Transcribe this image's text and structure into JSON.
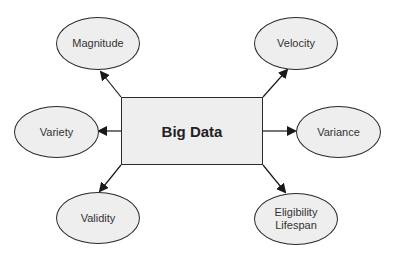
{
  "diagram": {
    "center": {
      "label": "Big Data"
    },
    "nodes": [
      {
        "id": "magnitude",
        "label": "Magnitude"
      },
      {
        "id": "velocity",
        "label": "Velocity"
      },
      {
        "id": "variety",
        "label": "Variety"
      },
      {
        "id": "variance",
        "label": "Variance"
      },
      {
        "id": "validity",
        "label": "Validity"
      },
      {
        "id": "eligibility-lifespan",
        "label": "Eligibility\nLifespan"
      }
    ],
    "edges": [
      {
        "from": "Big Data",
        "to": "Magnitude"
      },
      {
        "from": "Big Data",
        "to": "Velocity"
      },
      {
        "from": "Big Data",
        "to": "Variety"
      },
      {
        "from": "Big Data",
        "to": "Variance"
      },
      {
        "from": "Big Data",
        "to": "Validity"
      },
      {
        "from": "Big Data",
        "to": "Eligibility Lifespan"
      }
    ],
    "colors": {
      "fill": "#eeeeee",
      "stroke": "#2a2a2a",
      "text": "#333333"
    }
  }
}
